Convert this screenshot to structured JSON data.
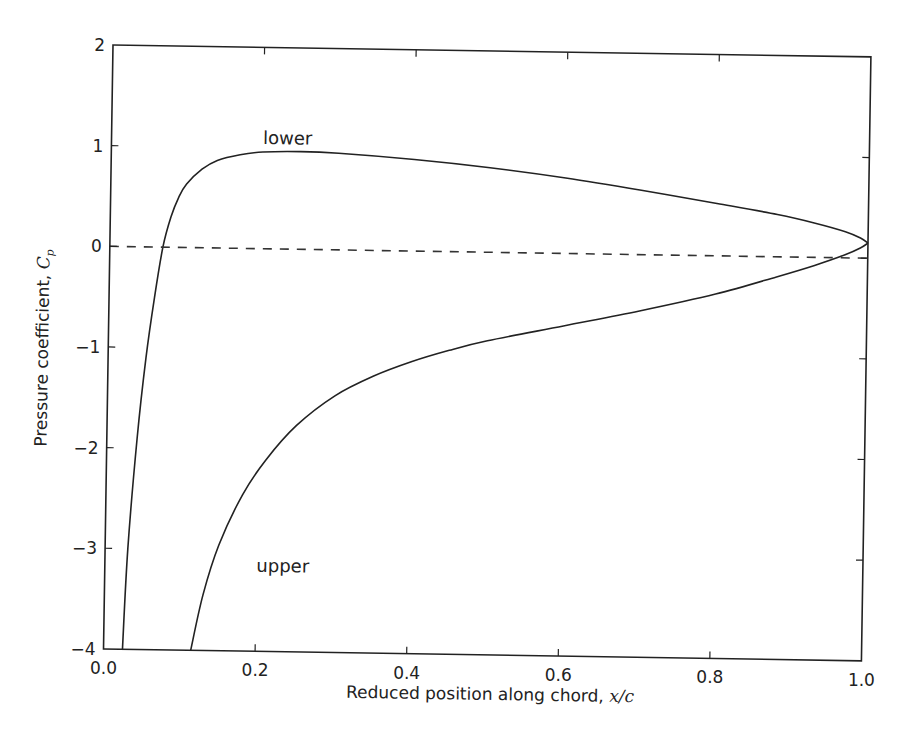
{
  "chart_data": {
    "type": "line",
    "title": "",
    "xlabel": "Reduced position along chord, x/c",
    "xlabel_text": "Reduced position along chord, ",
    "xlabel_math": "x/c",
    "ylabel": "Pressure coefficient, C_p",
    "ylabel_text": "Pressure coefficient, ",
    "ylabel_math": "C",
    "ylabel_sub": "p",
    "xlim": [
      0.0,
      1.0
    ],
    "ylim": [
      -4,
      2
    ],
    "xticks": [
      "0.0",
      "0.2",
      "0.4",
      "0.6",
      "0.8",
      "1.0"
    ],
    "yticks": [
      "2",
      "1",
      "0",
      "−1",
      "−2",
      "−3",
      "−4"
    ],
    "grid": false,
    "legend": null,
    "annotations": [
      {
        "text": "lower",
        "x": 0.2,
        "y": 1.1
      },
      {
        "text": "upper",
        "x": 0.2,
        "y": -3.15
      }
    ],
    "series": [
      {
        "name": "lower",
        "style": "solid",
        "color": "#222222",
        "x": [
          0.025,
          0.03,
          0.04,
          0.05,
          0.06,
          0.07,
          0.08,
          0.09,
          0.1,
          0.12,
          0.14,
          0.17,
          0.2,
          0.25,
          0.3,
          0.4,
          0.5,
          0.6,
          0.7,
          0.8,
          0.88,
          0.93,
          0.97,
          0.99,
          1.0
        ],
        "y": [
          -4.0,
          -3.0,
          -1.9,
          -1.1,
          -0.5,
          0.0,
          0.3,
          0.5,
          0.63,
          0.78,
          0.87,
          0.93,
          0.96,
          0.97,
          0.96,
          0.91,
          0.84,
          0.75,
          0.64,
          0.52,
          0.42,
          0.34,
          0.26,
          0.2,
          0.15
        ]
      },
      {
        "name": "upper",
        "style": "solid",
        "color": "#222222",
        "x": [
          0.115,
          0.13,
          0.15,
          0.18,
          0.21,
          0.25,
          0.3,
          0.35,
          0.4,
          0.45,
          0.5,
          0.6,
          0.7,
          0.8,
          0.88,
          0.93,
          0.97,
          0.99,
          1.0
        ],
        "y": [
          -4.0,
          -3.45,
          -2.95,
          -2.45,
          -2.1,
          -1.75,
          -1.45,
          -1.25,
          -1.1,
          -0.98,
          -0.88,
          -0.72,
          -0.56,
          -0.38,
          -0.2,
          -0.08,
          0.03,
          0.1,
          0.15
        ]
      },
      {
        "name": "zero reference",
        "style": "dashed",
        "color": "#333333",
        "x": [
          0.0,
          1.0
        ],
        "y": [
          0.0,
          0.0
        ]
      }
    ]
  }
}
